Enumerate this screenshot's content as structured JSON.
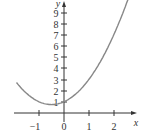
{
  "chart_data": {
    "type": "line",
    "title": "",
    "xlabel": "x",
    "ylabel": "y",
    "x_ticks": [
      "−1",
      "0",
      "1",
      "2"
    ],
    "y_ticks": [
      "1",
      "2",
      "3",
      "4",
      "5",
      "6",
      "7",
      "8",
      "9"
    ],
    "xlim": [
      -1.9,
      2.8
    ],
    "ylim": [
      0,
      10
    ],
    "grid": false,
    "legend": null,
    "series": [
      {
        "name": "curve",
        "approx_function": "y = x^2 + x + 1",
        "x": [
          -1.9,
          -1.5,
          -1.0,
          -0.5,
          0.0,
          0.5,
          1.0,
          1.5,
          2.0,
          2.5,
          2.6
        ],
        "y": [
          2.71,
          1.75,
          1.0,
          0.75,
          1.0,
          1.75,
          3.0,
          4.75,
          7.0,
          9.75,
          10.36
        ]
      }
    ],
    "color": "#888888"
  }
}
